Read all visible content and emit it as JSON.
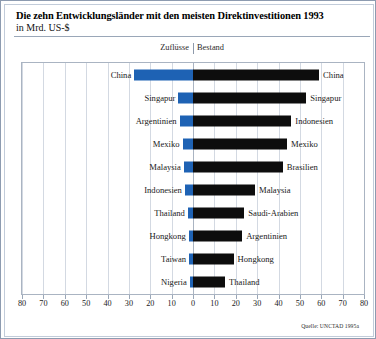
{
  "header": {
    "title": "Die zehn Entwicklungsländer mit den meisten Direktinvestitionen 1993",
    "subtitle": "in Mrd. US-$",
    "col_left": "Zuflüsse",
    "col_right": "Bestand"
  },
  "source": "Quelle: UNCTAD 1995a",
  "colors": {
    "inflow": "#1e62b4",
    "stock": "#0d0d0d",
    "frame": "#8d9bb0",
    "grid": "#d3d9e2"
  },
  "chart_data": {
    "type": "bar",
    "title": "Die zehn Entwicklungsländer mit den meisten Direktinvestitionen 1993",
    "subtitle": "in Mrd. US-$",
    "xlabel": "",
    "ylabel": "",
    "xlim": [
      -80,
      80
    ],
    "xticks": [
      80,
      70,
      60,
      50,
      40,
      30,
      20,
      10,
      0,
      10,
      20,
      30,
      40,
      50,
      60,
      70,
      80
    ],
    "grid": true,
    "legend_position": "top",
    "orientation": "horizontal-diverging",
    "series": [
      {
        "name": "Zuflüsse",
        "side": "left",
        "color": "#1e62b4",
        "categories": [
          "China",
          "Singapur",
          "Argentinien",
          "Mexiko",
          "Malaysia",
          "Indonesien",
          "Thailand",
          "Hongkong",
          "Taiwan",
          "Nigeria"
        ],
        "values": [
          27.5,
          6.8,
          6.3,
          4.9,
          4.3,
          3.8,
          2.4,
          2.0,
          1.8,
          1.5
        ]
      },
      {
        "name": "Bestand",
        "side": "right",
        "color": "#0d0d0d",
        "categories": [
          "China",
          "Singapur",
          "Indonesien",
          "Mexiko",
          "Brasilien",
          "Malaysia",
          "Saudi-Arabien",
          "Argentinien",
          "Hongkong",
          "Thailand"
        ],
        "values": [
          59.0,
          53.0,
          46.0,
          44.0,
          42.0,
          29.0,
          24.0,
          23.0,
          19.0,
          15.0
        ]
      }
    ]
  }
}
